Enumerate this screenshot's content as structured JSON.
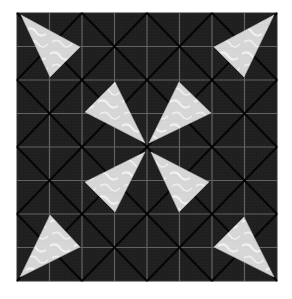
{
  "image": {
    "subject": "quilt-block",
    "description": "Dark fabric quilt block with a 4x4 grid of squares divided by diagonals, with eight light triangles forming a pinwheel/star pattern",
    "colors": {
      "background": "#ffffff",
      "fabric_dark": "#1e1e1e",
      "diagonal_lines": "#050505",
      "grid_lines": "#6a6a6a",
      "light_triangle": "#dcdcdc",
      "light_pattern": "#f4f4f4",
      "border": "#333333"
    },
    "block": {
      "x": 17,
      "y": 13,
      "width": 260,
      "height": 268,
      "grid": 4
    },
    "triangles": [
      {
        "name": "outer-top-left",
        "points": "21,15 80,47 50,77"
      },
      {
        "name": "outer-top-right",
        "points": "274,15 214,47 244,77"
      },
      {
        "name": "outer-bottom-left",
        "points": "20,277 50,215 80,247"
      },
      {
        "name": "outer-bottom-right",
        "points": "274,277 214,247 244,217"
      },
      {
        "name": "inner-top-left",
        "points": "85,112 115,82 145,143"
      },
      {
        "name": "inner-top-right",
        "points": "179,82 211,113 149,143"
      },
      {
        "name": "inner-bottom-left",
        "points": "145,152 85,182 115,212"
      },
      {
        "name": "inner-bottom-right",
        "points": "151,152 209,182 179,212"
      }
    ]
  }
}
